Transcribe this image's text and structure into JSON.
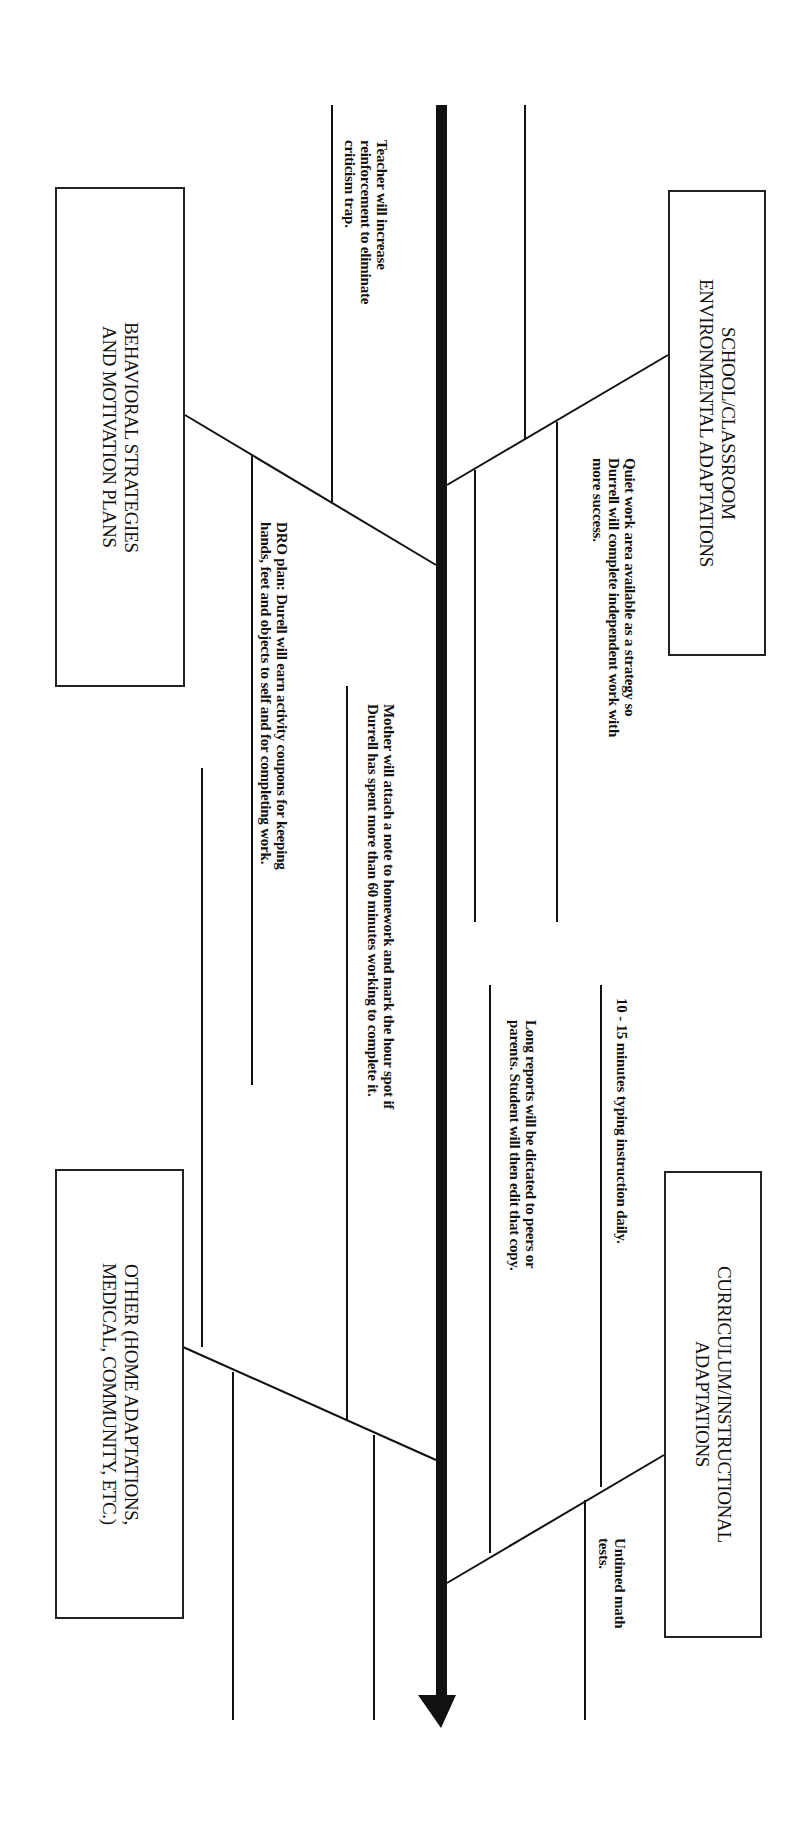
{
  "diagram": {
    "type": "fishbone",
    "orientation": "rotated-90-cw",
    "colors": {
      "line": "#111111",
      "spine": "#111111",
      "background": "#ffffff"
    },
    "categories": [
      {
        "id": "school",
        "label": "SCHOOL/CLASSROOM\nENVIRONMENTAL ADAPTATIONS",
        "notes": [
          "Quiet work area available as a strategy so\nDurrell will complete independent work with\nmore success."
        ]
      },
      {
        "id": "behavioral",
        "label": "BEHAVIORAL STRATEGIES\nAND MOTIVATION PLANS",
        "notes": [
          "Teacher will increase\nreinforcement to eliminate\ncriticism trap.",
          "DRO plan: Durell will earn activity coupons for keeping\nhands, feet and objects to self and for completing work."
        ]
      },
      {
        "id": "curriculum",
        "label": "CURRICULUM/INSTRUCTIONAL\nADAPTATIONS",
        "notes": [
          "10 - 15 minutes typing instruction daily.",
          "Long reports will be dictated to peers or\nparents. Student will then edit that copy.",
          "Untimed math\ntests."
        ]
      },
      {
        "id": "other",
        "label": "OTHER (HOME ADAPTATIONS,\nMEDICAL, COMMUNITY, ETC.)",
        "notes": [
          "Mother will attach a note to homework and mark the hour spot if\nDurrell has spent more than 60 minutes working to complete it."
        ]
      }
    ]
  }
}
